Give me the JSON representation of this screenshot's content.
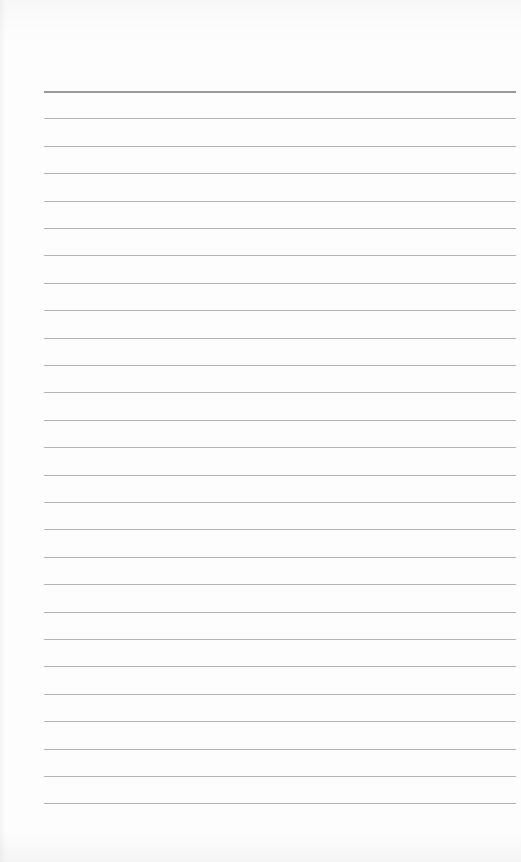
{
  "page": {
    "type": "blank ruled notebook page",
    "line_count": 27,
    "first_line_y": 91,
    "line_spacing": 27.4,
    "line_left": 44,
    "line_right": 516,
    "colors": {
      "paper": "#fdfdfd",
      "header_line": "#9a9a9a",
      "rule_line": "#b4b4b4"
    }
  }
}
